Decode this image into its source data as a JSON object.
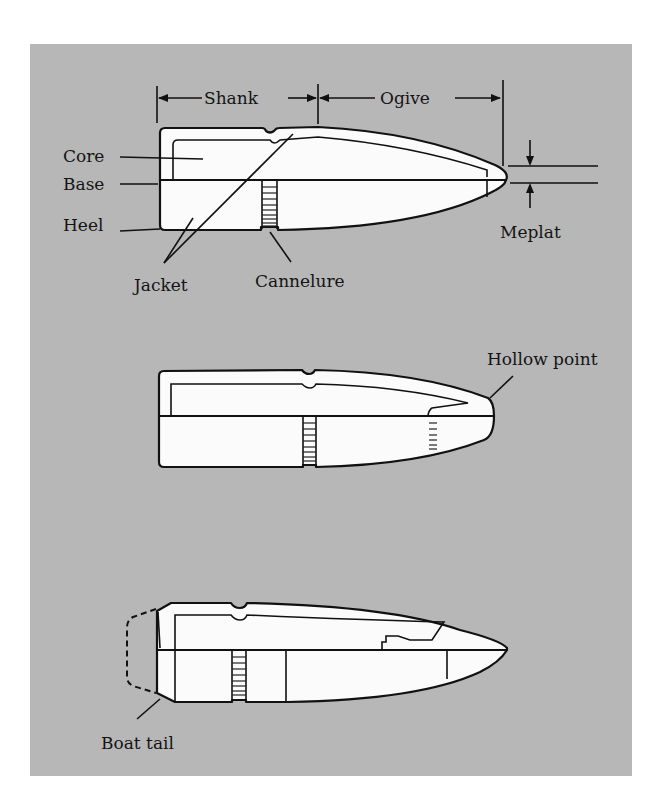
{
  "figure": {
    "background_color": "#b7b7b7",
    "line_color": "#111111",
    "bullet_fill": "#fbfbfb"
  },
  "bullet_1": {
    "dimension_labels": {
      "shank": "Shank",
      "ogive": "Ogive",
      "meplat": "Meplat"
    },
    "part_labels": {
      "core": "Core",
      "base": "Base",
      "heel": "Heel",
      "jacket": "Jacket",
      "cannelure": "Cannelure"
    }
  },
  "bullet_2": {
    "label": "Hollow point"
  },
  "bullet_3": {
    "label": "Boat tail"
  }
}
